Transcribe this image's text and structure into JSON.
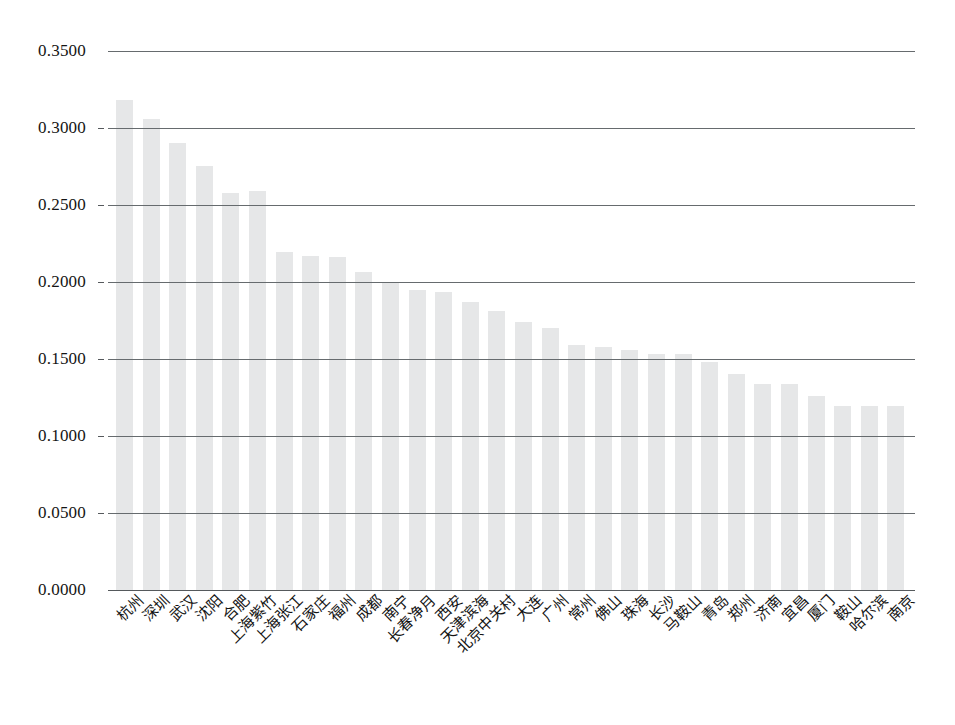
{
  "chart_data": {
    "type": "bar",
    "title": "",
    "xlabel": "",
    "ylabel": "",
    "ylim": [
      0.0,
      0.35
    ],
    "grid": true,
    "legend": null,
    "ytick_labels": [
      "0.3500",
      "0.3000",
      "0.2500",
      "0.2000",
      "0.1500",
      "0.1000",
      "0.0500",
      "0.0000"
    ],
    "ytick_values": [
      0.35,
      0.3,
      0.25,
      0.2,
      0.15,
      0.1,
      0.05,
      0.0
    ],
    "bar_color": "#e6e7e8",
    "axis_color": "#55595c",
    "categories": [
      "杭州",
      "深圳",
      "武汉",
      "沈阳",
      "合肥",
      "上海紫竹",
      "上海张江",
      "石家庄",
      "福州",
      "成都",
      "南宁",
      "长春净月",
      "西安",
      "天津滨海",
      "北京中关村",
      "大连",
      "广州",
      "常州",
      "佛山",
      "珠海",
      "长沙",
      "马鞍山",
      "青岛",
      "郑州",
      "济南",
      "宜昌",
      "厦门",
      "鞍山",
      "哈尔滨",
      "南京"
    ],
    "values": [
      0.318,
      0.306,
      0.29,
      0.2755,
      0.258,
      0.259,
      0.2195,
      0.217,
      0.216,
      0.2065,
      0.2,
      0.195,
      0.1935,
      0.187,
      0.181,
      0.174,
      0.17,
      0.159,
      0.158,
      0.156,
      0.1535,
      0.153,
      0.148,
      0.1405,
      0.134,
      0.134,
      0.126,
      0.1195,
      0.1195,
      0.1195
    ]
  }
}
